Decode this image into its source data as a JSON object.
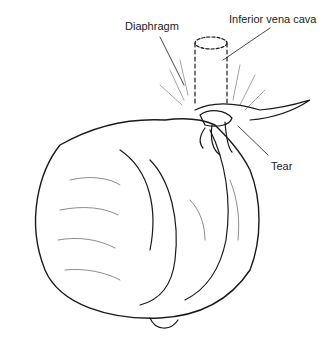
{
  "figure": {
    "labels": {
      "diaphragm": "Diaphragm",
      "ivc": "Inferior vena cava",
      "tear": "Tear"
    },
    "colors": {
      "line": "#1a1a1a",
      "background": "#ffffff"
    }
  }
}
